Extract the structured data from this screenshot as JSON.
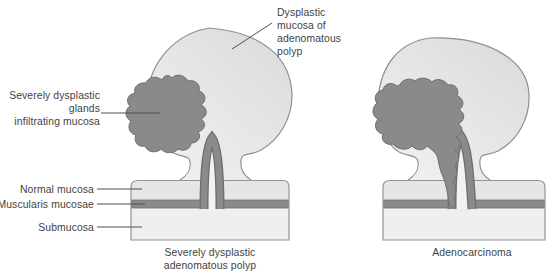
{
  "figure": {
    "colors": {
      "background": "#ffffff",
      "dysplastic_dark": "#8a8a8a",
      "dark_outline": "#6f6f6f",
      "shape_outline": "#929496",
      "normal_mucosa_fill": "#e6e6e6",
      "submucosa_fill": "#efefef",
      "arch_interior_fill": "#f2f2f2",
      "text": "#3f3f3f",
      "leader_line": "#4f4f4f"
    },
    "annotations": {
      "dysplastic_mucosa": "Dysplastic\nmucosa of\nadenomatous\npolyp",
      "dysplastic_glands": "Severely dysplastic\nglands\ninfiltrating mucosa",
      "normal_mucosa": "Normal mucosa",
      "muscularis_mucosae": "Muscularis mucosae",
      "submucosa": "Submucosa"
    },
    "captions": {
      "left": "Severely dysplastic\nadenomatous polyp",
      "right": "Adenocarcinoma"
    }
  }
}
